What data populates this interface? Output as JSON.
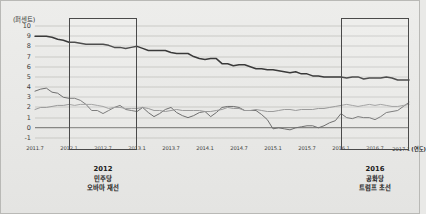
{
  "chart_data": {
    "type": "line",
    "title": "",
    "subtitle": "",
    "xlabel": "연도",
    "ylabel": "퍼센트",
    "unit_label": "(퍼센트)",
    "xaxis_unit_suffix": "(연도)",
    "grid": true,
    "legend_position": "none",
    "ylim": [
      -1,
      10
    ],
    "yticks": [
      10,
      9,
      8,
      7,
      6,
      5,
      4,
      3,
      2,
      1,
      0,
      -1
    ],
    "xlim": [
      "2011.7",
      "2017.1"
    ],
    "xticks": [
      "2011.7",
      "2012.1",
      "2012.7",
      "2013.1",
      "2013.7",
      "2014.1",
      "2014.7",
      "2015.1",
      "2015.7",
      "2016.1",
      "2016.7",
      "2017.1"
    ],
    "x": [
      "2011.7",
      "2011.8",
      "2011.9",
      "2011.10",
      "2011.11",
      "2011.12",
      "2012.1",
      "2012.2",
      "2012.3",
      "2012.4",
      "2012.5",
      "2012.6",
      "2012.7",
      "2012.8",
      "2012.9",
      "2012.10",
      "2012.11",
      "2012.12",
      "2013.1",
      "2013.2",
      "2013.3",
      "2013.4",
      "2013.5",
      "2013.6",
      "2013.7",
      "2013.8",
      "2013.9",
      "2013.10",
      "2013.11",
      "2013.12",
      "2014.1",
      "2014.2",
      "2014.3",
      "2014.4",
      "2014.5",
      "2014.6",
      "2014.7",
      "2014.8",
      "2014.9",
      "2014.10",
      "2014.11",
      "2014.12",
      "2015.1",
      "2015.2",
      "2015.3",
      "2015.4",
      "2015.5",
      "2015.6",
      "2015.7",
      "2015.8",
      "2015.9",
      "2015.10",
      "2015.11",
      "2015.12",
      "2016.1",
      "2016.2",
      "2016.3",
      "2016.4",
      "2016.5",
      "2016.6",
      "2016.7",
      "2016.8",
      "2016.9",
      "2016.10",
      "2016.11",
      "2016.12",
      "2017.1"
    ],
    "series": [
      {
        "name": "실업률",
        "color": "#3a3a3a",
        "width": 1.5,
        "values": [
          9.0,
          9.0,
          9.0,
          8.9,
          8.7,
          8.6,
          8.4,
          8.4,
          8.3,
          8.2,
          8.2,
          8.2,
          8.2,
          8.1,
          7.9,
          7.9,
          7.8,
          7.9,
          8.0,
          7.8,
          7.6,
          7.6,
          7.6,
          7.6,
          7.4,
          7.3,
          7.3,
          7.3,
          7.0,
          6.8,
          6.7,
          6.8,
          6.8,
          6.3,
          6.3,
          6.1,
          6.2,
          6.2,
          6.0,
          5.8,
          5.8,
          5.7,
          5.7,
          5.6,
          5.5,
          5.4,
          5.5,
          5.3,
          5.3,
          5.1,
          5.1,
          5.0,
          5.0,
          5.0,
          5.0,
          4.9,
          5.0,
          5.0,
          4.8,
          4.9,
          4.9,
          4.9,
          5.0,
          4.9,
          4.7,
          4.7,
          4.7
        ]
      },
      {
        "name": "소비자물가 상승률",
        "color": "#6f6f6f",
        "width": 1.0,
        "values": [
          3.6,
          3.8,
          3.9,
          3.5,
          3.4,
          3.0,
          2.9,
          2.9,
          2.7,
          2.3,
          1.7,
          1.7,
          1.4,
          1.7,
          2.0,
          2.2,
          1.8,
          1.7,
          1.6,
          2.0,
          1.5,
          1.1,
          1.4,
          1.8,
          2.0,
          1.5,
          1.2,
          1.0,
          1.2,
          1.5,
          1.6,
          1.1,
          1.5,
          2.0,
          2.1,
          2.1,
          2.0,
          1.7,
          1.7,
          1.7,
          1.3,
          0.8,
          -0.1,
          0.0,
          -0.1,
          -0.2,
          0.0,
          0.1,
          0.2,
          0.2,
          0.0,
          0.2,
          0.5,
          0.7,
          1.4,
          1.0,
          0.9,
          1.1,
          1.0,
          1.0,
          0.8,
          1.1,
          1.5,
          1.6,
          1.7,
          2.1,
          2.5
        ]
      },
      {
        "name": "근원물가 상승률",
        "color": "#9a9a9a",
        "width": 1.0,
        "values": [
          1.8,
          2.0,
          2.0,
          2.1,
          2.2,
          2.2,
          2.3,
          2.2,
          2.3,
          2.3,
          2.3,
          2.2,
          2.1,
          1.9,
          2.0,
          2.0,
          1.9,
          1.9,
          1.9,
          2.0,
          1.9,
          1.7,
          1.7,
          1.6,
          1.7,
          1.8,
          1.7,
          1.7,
          1.7,
          1.7,
          1.6,
          1.6,
          1.7,
          1.8,
          2.0,
          1.9,
          1.9,
          1.7,
          1.7,
          1.8,
          1.7,
          1.6,
          1.6,
          1.7,
          1.8,
          1.8,
          1.7,
          1.8,
          1.8,
          1.8,
          1.9,
          1.9,
          2.0,
          2.1,
          2.2,
          2.3,
          2.2,
          2.1,
          2.2,
          2.3,
          2.2,
          2.3,
          2.2,
          2.1,
          2.1,
          2.2,
          2.3
        ]
      }
    ],
    "annotations": [
      {
        "name": "election-2012",
        "x_center": "2012.7",
        "year": "2012",
        "line1": "민주당",
        "line2": "오바마 재선",
        "box_start": "2012.1",
        "box_end": "2013.1"
      },
      {
        "name": "election-2016",
        "x_center": "2016.7",
        "year": "2016",
        "line1": "공화당",
        "line2": "트럼프 초선",
        "box_start": "2016.1",
        "box_end": "2017.1"
      }
    ],
    "colors": {
      "background": "#e9e9e7",
      "grid": "#c9c9c6",
      "zero_line": "#6e6e6c",
      "box_border": "#4a4a4a",
      "text": "#1c1c1c"
    }
  }
}
